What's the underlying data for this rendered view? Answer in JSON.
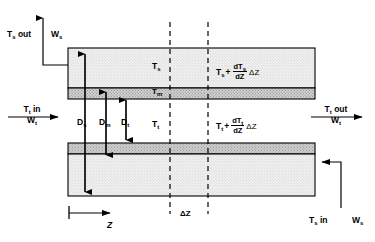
{
  "diagram": {
    "colors": {
      "outline": "#000000",
      "shell_fill": "#ececec",
      "metal_fill": "#c9c9c9",
      "tube_fill": "#ececec",
      "dashed": "#000000",
      "background": "#ffffff"
    },
    "streams": {
      "shell_out_temp": "T",
      "shell_out_temp_sub": "s",
      "shell_out_suffix": " out",
      "shell_out_flow": "W",
      "shell_out_flow_sub": "s",
      "shell_in_temp": "T",
      "shell_in_temp_sub": "s",
      "shell_in_suffix": " in",
      "shell_in_flow": "W",
      "shell_in_flow_sub": "s",
      "tube_in_temp": "T",
      "tube_in_temp_sub": "t",
      "tube_in_suffix": " in",
      "tube_in_flow": "W",
      "tube_in_flow_sub": "t",
      "tube_out_temp": "T",
      "tube_out_temp_sub": "t",
      "tube_out_suffix": " out",
      "tube_out_flow": "W",
      "tube_out_flow_sub": "t"
    },
    "temperatures": {
      "shell": "T",
      "shell_sub": "s",
      "metal": "T",
      "metal_sub": "m",
      "tube": "T",
      "tube_sub": "t"
    },
    "expressions": {
      "shell_outlet": {
        "base": "T",
        "base_sub": "s",
        "plus": "+",
        "numerator": "dT",
        "numerator_sub": "s",
        "denominator": "dZ",
        "delta": "ΔZ"
      },
      "tube_outlet": {
        "base": "T",
        "base_sub": "t",
        "plus": "+",
        "numerator": "dT",
        "numerator_sub": "t",
        "denominator": "dZ",
        "delta": "ΔZ"
      }
    },
    "diameters": [
      {
        "symbol": "D",
        "sub": "s",
        "name": "shell-diameter"
      },
      {
        "symbol": "D",
        "sub": "m",
        "name": "metal-diameter"
      },
      {
        "symbol": "D",
        "sub": "t",
        "name": "tube-diameter"
      }
    ],
    "axis": {
      "label": "Z",
      "element_length": "ΔZ"
    }
  }
}
